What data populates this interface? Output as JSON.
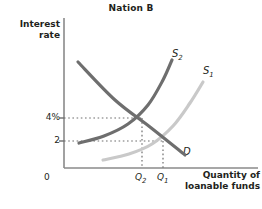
{
  "chart_data": {
    "type": "line",
    "title": "Nation B",
    "xlabel": "Quantity of loanable funds",
    "ylabel": "Interest rate",
    "origin_label": "0",
    "grid": false,
    "legend_position": "inline-curve-labels",
    "y_ticks": [
      {
        "label": "4%",
        "value": 4,
        "pixel_y": 118
      },
      {
        "label": "2",
        "value": 2,
        "pixel_y": 141
      }
    ],
    "x_ticks": [
      {
        "label": "Q2",
        "base": "Q",
        "sub": "2",
        "pixel_x": 142
      },
      {
        "label": "Q1",
        "base": "Q",
        "sub": "1",
        "pixel_x": 163
      }
    ],
    "series": [
      {
        "name": "D",
        "label_base": "D",
        "label_sub": "",
        "color": "#6e6e6e",
        "type": "demand",
        "description": "Downward-sloping demand curve for loanable funds",
        "points": [
          [
            78,
            62
          ],
          [
            115,
            100
          ],
          [
            150,
            127
          ],
          [
            185,
            155
          ]
        ]
      },
      {
        "name": "S2",
        "label_base": "S",
        "label_sub": "2",
        "color": "#6e6e6e",
        "type": "supply",
        "description": "New supply curve, shifted left; intersects D at 4% and Q2",
        "points": [
          [
            79,
            143
          ],
          [
            104,
            136
          ],
          [
            128,
            124
          ],
          [
            148,
            105
          ],
          [
            163,
            80
          ],
          [
            172,
            60
          ]
        ]
      },
      {
        "name": "S1",
        "label_base": "S",
        "label_sub": "1",
        "color": "#c9c9c9",
        "type": "supply",
        "description": "Original supply curve; intersects D at 2 and Q1",
        "points": [
          [
            103,
            160
          ],
          [
            129,
            154
          ],
          [
            152,
            144
          ],
          [
            173,
            126
          ],
          [
            190,
            103
          ],
          [
            203,
            82
          ]
        ]
      }
    ],
    "equilibria": [
      {
        "name": "S2 x D",
        "interest_rate": "4%",
        "quantity": "Q2",
        "pixel": [
          142,
          118
        ]
      },
      {
        "name": "S1 x D",
        "interest_rate": "2",
        "quantity": "Q1",
        "pixel": [
          163,
          141
        ]
      }
    ],
    "curve_labels": [
      {
        "base": "S",
        "sub": "2",
        "x": 172,
        "y": 48
      },
      {
        "base": "S",
        "sub": "1",
        "x": 203,
        "y": 65
      },
      {
        "base": "D",
        "sub": "",
        "x": 183,
        "y": 146
      }
    ],
    "axes": {
      "y_axis_x": 64,
      "x_axis_y": 168,
      "y_axis_top": 18,
      "x_axis_right": 258,
      "color": "#8a8a8a"
    },
    "colors": {
      "dark_curve": "#6e6e6e",
      "light_curve": "#c9c9c9",
      "axis": "#8a8a8a",
      "text": "#231f20",
      "dotted": "#6e6e6e"
    }
  }
}
